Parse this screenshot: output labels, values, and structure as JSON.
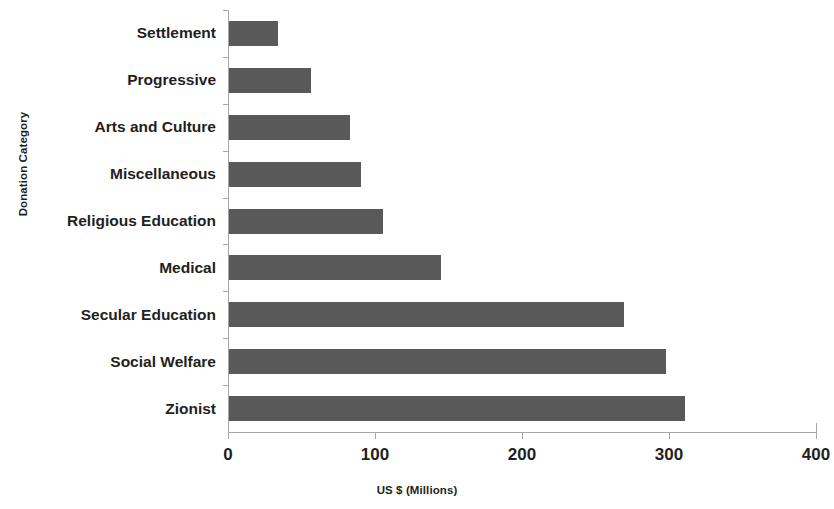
{
  "chart_data": {
    "type": "bar",
    "orientation": "horizontal",
    "title": "",
    "xlabel": "US $ (Millions)",
    "ylabel": "Donation Category",
    "xlim": [
      0,
      400
    ],
    "xticks": [
      "0",
      "100",
      "200",
      "300",
      "400"
    ],
    "xtick_values": [
      0,
      100,
      200,
      300,
      400
    ],
    "grid": false,
    "legend": "none",
    "bar_color": "#595959",
    "axis_color": "#a6a6a6",
    "background_color": "#ffffff",
    "categories": [
      "Settlement",
      "Progressive",
      "Arts and Culture",
      "Miscellaneous",
      "Religious Education",
      "Medical",
      "Secular Education",
      "Social Welfare",
      "Zionist"
    ],
    "values": [
      33,
      56,
      82,
      90,
      105,
      144,
      269,
      297,
      310
    ]
  }
}
